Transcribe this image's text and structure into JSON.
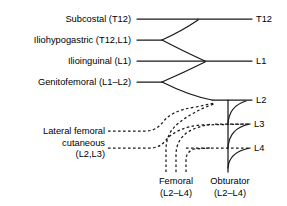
{
  "figure": {
    "stroke_color": "#1a1a1a",
    "background_color": "#ffffff"
  },
  "left_nerves": [
    {
      "label": "Subcostal (T12)",
      "y": 19
    },
    {
      "label": "Iliohypogastric (T12,L1)",
      "y": 40
    },
    {
      "label": "Ilioinguinal (L1)",
      "y": 61
    },
    {
      "label": "Genitofemoral (L1–L2)",
      "y": 82
    }
  ],
  "spinal_levels": [
    {
      "label": "T12",
      "y": 19
    },
    {
      "label": "L1",
      "y": 61
    },
    {
      "label": "L2",
      "y": 100
    },
    {
      "label": "L3",
      "y": 124
    },
    {
      "label": "L4",
      "y": 148
    }
  ],
  "lateral_femoral_cutaneous": {
    "line1": "Lateral femoral",
    "line2": "cutaneous",
    "line3": "(L2,L3)"
  },
  "bottom_nerves": [
    {
      "name": "Femoral",
      "roots": "(L2–L4)",
      "x": 176
    },
    {
      "name": "Obturator",
      "roots": "(L2–L4)",
      "x": 228
    }
  ]
}
